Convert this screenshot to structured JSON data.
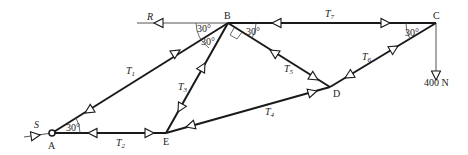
{
  "diagram": {
    "type": "truss free-body diagram",
    "joints": [
      {
        "id": "A",
        "label": "A"
      },
      {
        "id": "B",
        "label": "B"
      },
      {
        "id": "C",
        "label": "C"
      },
      {
        "id": "D",
        "label": "D"
      },
      {
        "id": "E",
        "label": "E"
      }
    ],
    "members": [
      {
        "id": "T1",
        "label": "T",
        "sub": "1",
        "from": "A",
        "to": "B"
      },
      {
        "id": "T2",
        "label": "T",
        "sub": "2",
        "from": "A",
        "to": "E"
      },
      {
        "id": "T3",
        "label": "T",
        "sub": "3",
        "from": "E",
        "to": "B"
      },
      {
        "id": "T4",
        "label": "T",
        "sub": "4",
        "from": "E",
        "to": "D"
      },
      {
        "id": "T5",
        "label": "T",
        "sub": "5",
        "from": "B",
        "to": "D"
      },
      {
        "id": "T6",
        "label": "T",
        "sub": "6",
        "from": "D",
        "to": "C"
      },
      {
        "id": "T7",
        "label": "T",
        "sub": "7",
        "from": "B",
        "to": "C"
      }
    ],
    "external_forces": [
      {
        "id": "R",
        "label": "R",
        "at": "B",
        "direction": "left"
      },
      {
        "id": "S",
        "label": "S",
        "at": "A",
        "direction": "along T1 axis"
      },
      {
        "id": "load",
        "label": "400 N",
        "at": "C",
        "direction": "down"
      }
    ],
    "angles": [
      {
        "at": "B",
        "label": "30°",
        "between": "R-line and T1"
      },
      {
        "at": "B",
        "label": "30°",
        "between": "T1 and T3"
      },
      {
        "at": "B",
        "label": "30°",
        "between": "T7 and T5"
      },
      {
        "at": "C",
        "label": "30°",
        "between": "T7 and T6"
      },
      {
        "at": "A",
        "label": "30°",
        "between": "T2 and T1"
      }
    ],
    "right_angle_at": "B (between T3 and T5)"
  }
}
